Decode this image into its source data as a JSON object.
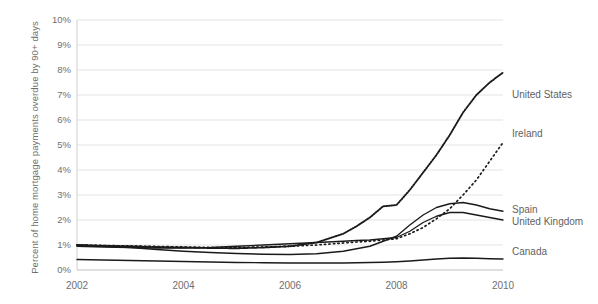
{
  "chart_data": {
    "type": "line",
    "title": "",
    "xlabel": "",
    "ylabel": "Percent of home mortgage payments overdue by 90+ days",
    "xlim": [
      2002,
      2010
    ],
    "ylim": [
      0,
      10
    ],
    "ytick_labels": [
      "10%",
      "9%",
      "8%",
      "7%",
      "6%",
      "5%",
      "4%",
      "3%",
      "2%",
      "1%",
      "0%"
    ],
    "ytick_values": [
      10,
      9,
      8,
      7,
      6,
      5,
      4,
      3,
      2,
      1,
      0
    ],
    "xtick_labels": [
      "2002",
      "2004",
      "2006",
      "2008",
      "2010"
    ],
    "xtick_values": [
      2002,
      2004,
      2006,
      2008,
      2010
    ],
    "grid": true,
    "legend_position": "right-inline",
    "x": [
      2002,
      2002.5,
      2003,
      2003.5,
      2004,
      2004.5,
      2005,
      2005.5,
      2006,
      2006.5,
      2007,
      2007.25,
      2007.5,
      2007.75,
      2008,
      2008.25,
      2008.5,
      2008.75,
      2009,
      2009.25,
      2009.5,
      2009.75,
      2010
    ],
    "series": [
      {
        "name": "United States",
        "style": "dotted",
        "label": "United States",
        "values": [
          1.0,
          0.97,
          0.95,
          0.92,
          0.9,
          0.88,
          0.87,
          0.9,
          0.95,
          1.1,
          1.45,
          1.75,
          2.1,
          2.55,
          2.6,
          3.2,
          3.9,
          4.6,
          5.4,
          6.3,
          7.0,
          7.5,
          7.9
        ]
      },
      {
        "name": "Ireland",
        "style": "dotted-sparse",
        "label": "Ireland",
        "values": [
          1.0,
          0.98,
          0.96,
          0.94,
          0.92,
          0.9,
          0.9,
          0.92,
          0.95,
          1.0,
          1.08,
          1.12,
          1.15,
          1.2,
          1.25,
          1.45,
          1.7,
          2.05,
          2.45,
          3.0,
          3.6,
          4.35,
          5.1
        ]
      },
      {
        "name": "Spain",
        "style": "solid",
        "label": "Spain",
        "values": [
          1.0,
          0.95,
          0.9,
          0.82,
          0.75,
          0.7,
          0.66,
          0.63,
          0.62,
          0.65,
          0.75,
          0.85,
          0.95,
          1.15,
          1.35,
          1.8,
          2.2,
          2.5,
          2.65,
          2.7,
          2.6,
          2.45,
          2.35
        ]
      },
      {
        "name": "United Kingdom",
        "style": "solid",
        "label": "United Kingdom",
        "values": [
          0.95,
          0.92,
          0.9,
          0.88,
          0.88,
          0.9,
          0.95,
          1.0,
          1.05,
          1.1,
          1.15,
          1.18,
          1.2,
          1.25,
          1.3,
          1.55,
          1.9,
          2.15,
          2.3,
          2.3,
          2.2,
          2.1,
          2.0
        ]
      },
      {
        "name": "Canada",
        "style": "solid",
        "label": "Canada",
        "values": [
          0.42,
          0.4,
          0.38,
          0.36,
          0.34,
          0.32,
          0.3,
          0.29,
          0.28,
          0.28,
          0.28,
          0.29,
          0.3,
          0.31,
          0.33,
          0.36,
          0.4,
          0.44,
          0.47,
          0.48,
          0.47,
          0.45,
          0.44
        ]
      }
    ],
    "label_anchors": [
      {
        "name": "United States",
        "x": 512,
        "y": 95
      },
      {
        "name": "Ireland",
        "x": 512,
        "y": 134
      },
      {
        "name": "Spain",
        "x": 512,
        "y": 210
      },
      {
        "name": "United Kingdom",
        "x": 512,
        "y": 222
      },
      {
        "name": "Canada",
        "x": 512,
        "y": 252
      }
    ],
    "colors": {
      "line": "#1a1a1a",
      "grid": "#e3e3e3",
      "axis": "#cfcfcf",
      "text": "#6f6f6f",
      "background": "#ffffff"
    }
  }
}
